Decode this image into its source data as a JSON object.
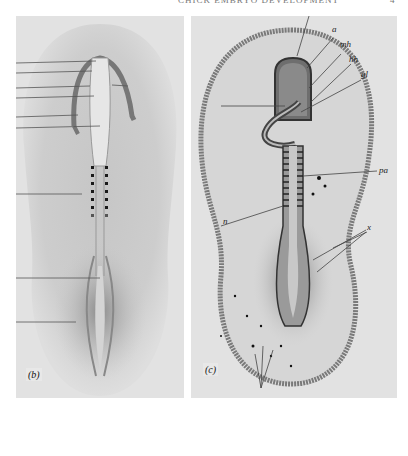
{
  "page": {
    "running_head": "CHICK EMBRYO DEVELOPMENT",
    "page_number": "4"
  },
  "figure": {
    "panels": [
      {
        "id": "b",
        "caption": "(b)",
        "description": "Early chick embryo, dorsal view: head fold with neural folds, somites (7 pairs), primitive streak; unlabelled leader lines on left",
        "somite_pairs": 7,
        "leader_lines": 9
      },
      {
        "id": "c",
        "caption": "(c)",
        "description": "Later chick embryo, dorsal view: head region, heart, neural tube with somites, area pellucida boundary",
        "labels": [
          {
            "text": "a",
            "meaning": "amnion"
          },
          {
            "text": "mh",
            "meaning": "midbrain"
          },
          {
            "text": "hh",
            "meaning": "hindbrain"
          },
          {
            "text": "gl",
            "meaning": "gut/heart region"
          },
          {
            "text": "pa",
            "meaning": "proamnion / area pellucida"
          },
          {
            "text": "n",
            "meaning": "notochord/neural"
          },
          {
            "text": "x",
            "meaning": "blood islands"
          }
        ]
      }
    ]
  }
}
